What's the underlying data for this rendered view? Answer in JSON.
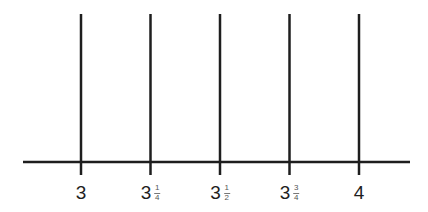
{
  "diagram": {
    "type": "number-line",
    "range": [
      3,
      4
    ],
    "line_color": "#1e1e1e",
    "ticks": [
      {
        "value": 3,
        "whole": "3",
        "num": "",
        "den": ""
      },
      {
        "value": 3.25,
        "whole": "3",
        "num": "1",
        "den": "4"
      },
      {
        "value": 3.5,
        "whole": "3",
        "num": "1",
        "den": "2"
      },
      {
        "value": 3.75,
        "whole": "3",
        "num": "3",
        "den": "4"
      },
      {
        "value": 4,
        "whole": "4",
        "num": "",
        "den": ""
      }
    ]
  }
}
